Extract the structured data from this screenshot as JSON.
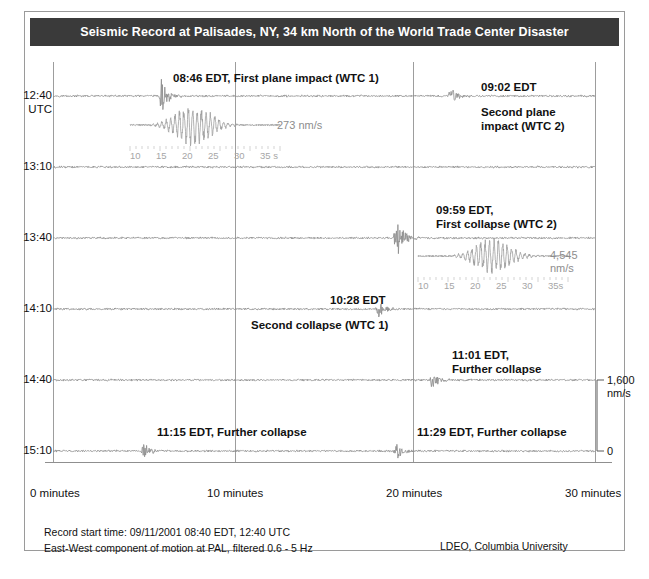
{
  "header": {
    "title": "Seismic Record at Palisades, NY, 34 km North of the World Trade Center Disaster"
  },
  "footer": {
    "line1": "Record start time: 09/11/2001 08:40 EDT, 12:40 UTC",
    "line2": "East-West component of motion at PAL, filtered 0.6 - 5 Hz",
    "credit": "LDEO, Columbia University"
  },
  "axes": {
    "y_unit": "UTC",
    "y_ticks": [
      "12:40",
      "13:10",
      "13:40",
      "14:10",
      "14:40",
      "15:10"
    ],
    "x_ticks": [
      "0 minutes",
      "10 minutes",
      "20 minutes",
      "30 minutes"
    ],
    "x_values": [
      0,
      10,
      20,
      30
    ]
  },
  "scale_bar": {
    "top": "1,600",
    "top_unit": "nm/s",
    "bottom": "0"
  },
  "annotations": [
    {
      "id": "first-plane-impact",
      "text": "08:46 EDT, First plane impact (WTC 1)"
    },
    {
      "id": "second-plane-impact-time",
      "text": "09:02 EDT"
    },
    {
      "id": "second-plane-impact-l1",
      "text": "Second plane"
    },
    {
      "id": "second-plane-impact-l2",
      "text": "impact (WTC 2)"
    },
    {
      "id": "first-collapse-l1",
      "text": "09:59 EDT,"
    },
    {
      "id": "first-collapse-l2",
      "text": "First collapse (WTC 2)"
    },
    {
      "id": "second-collapse-time",
      "text": "10:28 EDT"
    },
    {
      "id": "second-collapse-label",
      "text": "Second collapse (WTC 1)"
    },
    {
      "id": "further-collapse-1101-l1",
      "text": "11:01 EDT,"
    },
    {
      "id": "further-collapse-1101-l2",
      "text": "Further collapse"
    },
    {
      "id": "further-collapse-1115",
      "text": "11:15 EDT, Further collapse"
    },
    {
      "id": "further-collapse-1129",
      "text": "11:29 EDT, Further collapse"
    }
  ],
  "insets": [
    {
      "id": "inset-first-plane-impact",
      "amplitude": "273 nm/s",
      "amplitude_value": 273,
      "amplitude_unit": "nm/s",
      "tick_labels": [
        "10",
        "15",
        "20",
        "25",
        "30",
        "35 s"
      ]
    },
    {
      "id": "inset-first-collapse",
      "amplitude_l1": "4,545",
      "amplitude_l2": "nm/s",
      "amplitude_value": 4545,
      "amplitude_unit": "nm/s",
      "tick_labels": [
        "10",
        "15",
        "20",
        "25",
        "30",
        "35s"
      ]
    }
  ],
  "chart_data": {
    "type": "line",
    "title": "Seismic Record at Palisades, NY, 34 km North of the World Trade Center Disaster",
    "xlabel": "minutes",
    "ylabel": "UTC",
    "grid": true,
    "legend": "none",
    "xlim": [
      0,
      30
    ],
    "ylim_time": [
      "12:40",
      "15:40"
    ],
    "row_duration_minutes": 30,
    "rows": [
      {
        "start_utc": "12:40",
        "start_edt": "08:40"
      },
      {
        "start_utc": "13:10",
        "start_edt": "09:10"
      },
      {
        "start_utc": "13:40",
        "start_edt": "09:40"
      },
      {
        "start_utc": "14:10",
        "start_edt": "10:10"
      },
      {
        "start_utc": "14:40",
        "start_edt": "10:40"
      },
      {
        "start_utc": "15:10",
        "start_edt": "11:10"
      }
    ],
    "events": [
      {
        "label": "First plane impact (WTC 1)",
        "time_edt": "08:46",
        "row": 0,
        "minute_in_row": 6,
        "amplitude_nm_s": 273
      },
      {
        "label": "Second plane impact (WTC 2)",
        "time_edt": "09:02",
        "row": 0,
        "minute_in_row": 22,
        "amplitude_nm_s": null
      },
      {
        "label": "First collapse (WTC 2)",
        "time_edt": "09:59",
        "row": 2,
        "minute_in_row": 19,
        "amplitude_nm_s": 4545
      },
      {
        "label": "Second collapse (WTC 1)",
        "time_edt": "10:28",
        "row": 3,
        "minute_in_row": 18,
        "amplitude_nm_s": null
      },
      {
        "label": "Further collapse",
        "time_edt": "11:01",
        "row": 4,
        "minute_in_row": 21,
        "amplitude_nm_s": null
      },
      {
        "label": "Further collapse",
        "time_edt": "11:15",
        "row": 5,
        "minute_in_row": 5,
        "amplitude_nm_s": null
      },
      {
        "label": "Further collapse",
        "time_edt": "11:29",
        "row": 5,
        "minute_in_row": 19,
        "amplitude_nm_s": null
      }
    ],
    "scale_reference": {
      "value": 1600,
      "unit": "nm/s",
      "baseline": 0
    },
    "inset_time_axis": {
      "unit": "s",
      "ticks": [
        10,
        15,
        20,
        25,
        30,
        35
      ]
    }
  },
  "colors": {
    "title_bg": "#3a3a3a",
    "title_fg": "#ffffff",
    "trace": "#808080",
    "grid": "#9d9d9d",
    "text": "#111111",
    "muted": "#9a9a9a"
  }
}
